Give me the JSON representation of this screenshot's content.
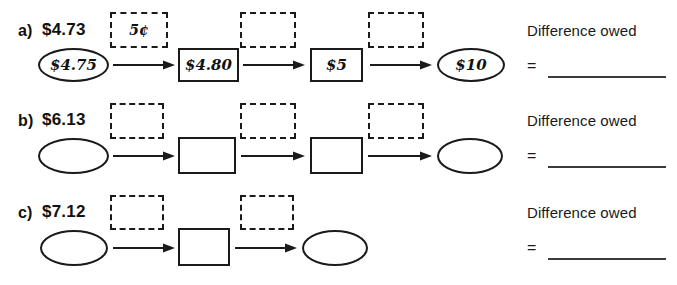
{
  "worksheet": {
    "answer_label": "Difference owed",
    "equals_symbol": "=",
    "rows": [
      {
        "tag": "a)",
        "start_amount": "$4.73",
        "nodes": [
          {
            "shape": "ellipse",
            "label": "$4.75"
          },
          {
            "shape": "rect",
            "label": "$4.80"
          },
          {
            "shape": "rect",
            "label": "$5"
          },
          {
            "shape": "ellipse",
            "label": "$10"
          }
        ],
        "steps": [
          {
            "label": "5¢"
          },
          {
            "label": ""
          },
          {
            "label": ""
          }
        ],
        "answer_value": ""
      },
      {
        "tag": "b)",
        "start_amount": "$6.13",
        "nodes": [
          {
            "shape": "ellipse",
            "label": ""
          },
          {
            "shape": "rect",
            "label": ""
          },
          {
            "shape": "rect",
            "label": ""
          },
          {
            "shape": "ellipse",
            "label": ""
          }
        ],
        "steps": [
          {
            "label": ""
          },
          {
            "label": ""
          },
          {
            "label": ""
          }
        ],
        "answer_value": ""
      },
      {
        "tag": "c)",
        "start_amount": "$7.12",
        "nodes": [
          {
            "shape": "ellipse",
            "label": ""
          },
          {
            "shape": "rect",
            "label": ""
          },
          {
            "shape": "ellipse",
            "label": ""
          }
        ],
        "steps": [
          {
            "label": ""
          },
          {
            "label": ""
          }
        ],
        "answer_value": ""
      }
    ]
  },
  "colors": {
    "ink": "#1a1a1a",
    "rule": "#3b3b3b",
    "paper": "#ffffff"
  }
}
